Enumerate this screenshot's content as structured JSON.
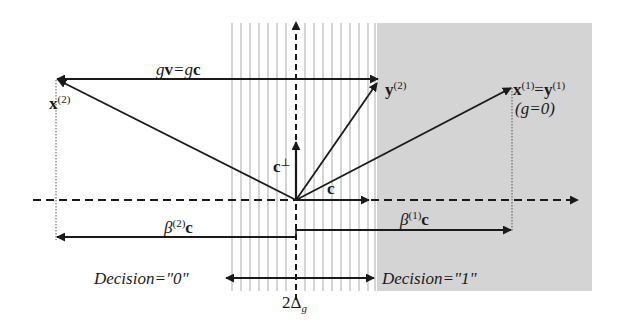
{
  "diagram": {
    "colors": {
      "ink": "#1a1a1a",
      "gray_region": "#d4d4d4",
      "stripe": "#bdbdbd",
      "background": "#ffffff"
    },
    "regions": {
      "striped_band": {
        "name": "uncertainty band 2Δg",
        "x0": 231,
        "x1": 376
      },
      "gray_region": {
        "name": "decision-1 region",
        "x0": 377,
        "x1": 592
      }
    },
    "labels": {
      "gv_gc": {
        "pre": "g",
        "v": "v",
        "mid": "=g",
        "c": "c"
      },
      "x2": {
        "base": "x",
        "sup": "(2)"
      },
      "y2": {
        "base": "y",
        "sup": "(2)"
      },
      "x1y1": {
        "x": "x",
        "sup1": "(1)",
        "eq": "=",
        "y": "y",
        "sup2": "(1)"
      },
      "g0": "(g=0)",
      "c_perp": {
        "base": "c",
        "sup": "⊥"
      },
      "c": "c",
      "beta2c": {
        "beta": "β",
        "sup": "(2)",
        "c": "c"
      },
      "beta1c": {
        "beta": "β",
        "sup": "(1)",
        "c": "c"
      },
      "decision0": "Decision=\"0\"",
      "decision1": "Decision=\"1\"",
      "two_delta": {
        "pre": "2Δ",
        "sub": "g"
      }
    }
  }
}
